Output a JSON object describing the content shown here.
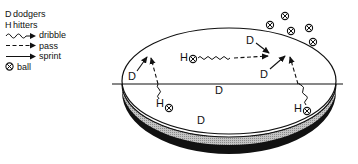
{
  "legend": {
    "items": [
      {
        "key": "D",
        "label": "dodgers"
      },
      {
        "key": "H",
        "label": "hitters"
      },
      {
        "symbol": "wavy-arrow",
        "label": "dribble"
      },
      {
        "symbol": "dashed-arrow",
        "label": "pass"
      },
      {
        "symbol": "solid-arrow",
        "label": "sprint"
      },
      {
        "symbol": "ball",
        "label": "ball"
      }
    ]
  },
  "court": {
    "labels": {
      "d_left": "D",
      "d_top": "D",
      "d_right": "D",
      "d_center": "D",
      "d_bottom": "D",
      "h_middle": "H",
      "h_left": "H",
      "h_right": "H"
    }
  },
  "colors": {
    "ink": "#111111",
    "rim_gray": "#a8a8a8",
    "rim_black": "#111111",
    "background": "#ffffff"
  }
}
